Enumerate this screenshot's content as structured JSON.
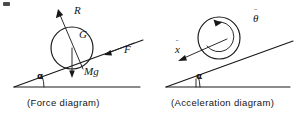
{
  "figure": {
    "background_color": "#ffffff",
    "ink_color": "#181818",
    "width": 304,
    "height": 116
  },
  "diagrams": [
    {
      "id": "force-diagram",
      "caption": "(Force diagram)",
      "incline_angle_label": "α",
      "body": "circle",
      "labels": [
        {
          "name": "normal-reaction",
          "text": "R",
          "meaning": "normal reaction force, arrow perpendicular to incline pointing up-left"
        },
        {
          "name": "centre-of-gravity",
          "text": "G",
          "meaning": "centre of gravity marker inside circle"
        },
        {
          "name": "friction-force",
          "text": "F",
          "meaning": "friction force, arrow along incline pointing up-right"
        },
        {
          "name": "weight",
          "text": "Mg",
          "meaning": "weight, arrow vertically downward from centre"
        }
      ]
    },
    {
      "id": "acceleration-diagram",
      "caption": "(Acceleration diagram)",
      "incline_angle_label": "α",
      "body": "circle",
      "labels": [
        {
          "name": "angular-acceleration",
          "text": "θ",
          "accent": "¨",
          "meaning": "theta double dot, angular acceleration, curved arrow clockwise inside circle"
        },
        {
          "name": "linear-acceleration",
          "text": "x",
          "accent": "¨",
          "meaning": "x double dot, linear acceleration along incline pointing down-left"
        }
      ]
    }
  ],
  "labels": {
    "R": "R",
    "G": "G",
    "F": "F",
    "Mg": "Mg",
    "alpha_left": "α",
    "alpha_right": "α",
    "theta": "θ",
    "theta_dots": "¨",
    "x": "x",
    "x_dots": "¨"
  },
  "captions": {
    "force": "(Force diagram)",
    "acceleration": "(Acceleration diagram)"
  }
}
